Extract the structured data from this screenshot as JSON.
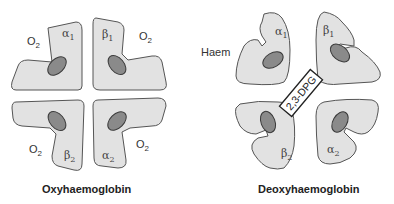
{
  "colors": {
    "subunit_fill": "#e2e2e2",
    "subunit_stroke": "#555555",
    "haem_fill": "#8a8a8a",
    "haem_stroke": "#3a3a3a",
    "background": "#ffffff"
  },
  "oxy": {
    "title": "Oxyhaemoglobin",
    "subunits": [
      {
        "letter": "α",
        "sub": "1"
      },
      {
        "letter": "β",
        "sub": "1"
      },
      {
        "letter": "β",
        "sub": "2"
      },
      {
        "letter": "α",
        "sub": "2"
      }
    ],
    "o2_labels": [
      {
        "main": "O",
        "sub": "2"
      },
      {
        "main": "O",
        "sub": "2"
      },
      {
        "main": "O",
        "sub": "2"
      },
      {
        "main": "O",
        "sub": "2"
      }
    ]
  },
  "deoxy": {
    "title": "Deoxyhaemoglobin",
    "haem_label": "Haem",
    "dpg_label": "2,3-DPG",
    "subunits": [
      {
        "letter": "α",
        "sub": "1"
      },
      {
        "letter": "β",
        "sub": "1"
      },
      {
        "letter": "β",
        "sub": "2"
      },
      {
        "letter": "α",
        "sub": "2"
      }
    ]
  }
}
